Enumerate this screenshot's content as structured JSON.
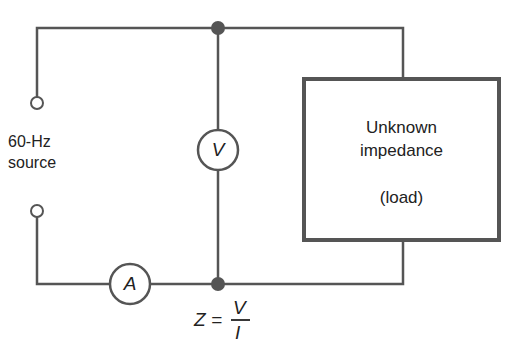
{
  "diagram": {
    "source": {
      "line1": "60-Hz",
      "line2": "source"
    },
    "load_box": {
      "line1": "Unknown",
      "line2": "impedance",
      "line3": "(load)"
    },
    "voltmeter": {
      "symbol": "V"
    },
    "ammeter": {
      "symbol": "A"
    },
    "formula": {
      "lhs": "Z =",
      "numerator": "V",
      "denominator": "I"
    },
    "colors": {
      "wire": "#555555",
      "junction": "#555555",
      "text": "#222222",
      "background": "#ffffff"
    }
  }
}
